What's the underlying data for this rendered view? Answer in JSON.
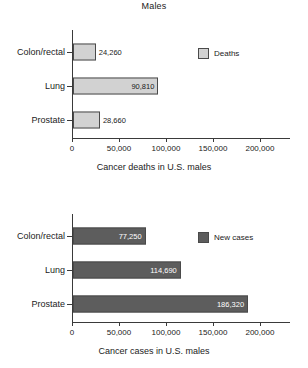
{
  "figure": {
    "title": "Males"
  },
  "chart_data": [
    {
      "type": "bar",
      "orientation": "horizontal",
      "title": "Males",
      "categories": [
        "Colon/rectal",
        "Lung",
        "Prostate"
      ],
      "values": [
        24260,
        90810,
        28660
      ],
      "value_labels": [
        "24,260",
        "90,810",
        "28,660"
      ],
      "series": [
        {
          "name": "Deaths",
          "values": [
            24260,
            90810,
            28660
          ],
          "color": "#d2d2d2"
        }
      ],
      "legend": [
        "Deaths"
      ],
      "legend_position": "top-right",
      "xlabel": "Cancer deaths in U.S. males",
      "ylabel": "",
      "xlim": [
        0,
        232000
      ],
      "xticks": [
        0,
        50000,
        100000,
        150000,
        200000
      ],
      "xtick_labels": [
        "0",
        "50,000",
        "100,000",
        "150,000",
        "200,000"
      ],
      "grid": false
    },
    {
      "type": "bar",
      "orientation": "horizontal",
      "title": "",
      "categories": [
        "Colon/rectal",
        "Lung",
        "Prostate"
      ],
      "values": [
        77250,
        114690,
        186320
      ],
      "value_labels": [
        "77,250",
        "114,690",
        "186,320"
      ],
      "series": [
        {
          "name": "New cases",
          "values": [
            77250,
            114690,
            186320
          ],
          "color": "#5d5d5d"
        }
      ],
      "legend": [
        "New cases"
      ],
      "legend_position": "top-right",
      "xlabel": "Cancer cases in U.S. males",
      "ylabel": "",
      "xlim": [
        0,
        232000
      ],
      "xticks": [
        0,
        50000,
        100000,
        150000,
        200000
      ],
      "xtick_labels": [
        "0",
        "50,000",
        "100,000",
        "150,000",
        "200,000"
      ],
      "grid": false
    }
  ]
}
